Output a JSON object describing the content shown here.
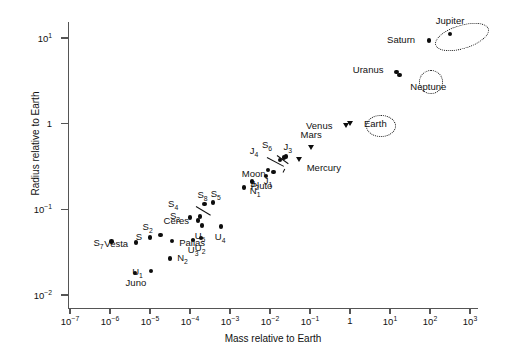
{
  "chart_data": {
    "type": "scatter",
    "title": "",
    "xlabel": "Mass relative to Earth",
    "ylabel": "Radius relative to Earth",
    "xscale": "log",
    "yscale": "log",
    "xlim": [
      1e-07,
      1000.0
    ],
    "ylim": [
      0.01,
      30
    ],
    "xticks": [
      "10-7",
      "10-6",
      "10-5",
      "10-4",
      "10-3",
      "10-2",
      "10-1",
      "1",
      "101",
      "102",
      "103"
    ],
    "yticks": [
      "101",
      "1",
      "10-1",
      "10-2"
    ],
    "grid": false,
    "legend": "none",
    "marker_types": {
      "planet": "down-triangle",
      "moon-or-asteroid": "filled-circle"
    },
    "points": [
      {
        "name": "Jupiter",
        "mass": 318,
        "radius": 11.2,
        "marker": "dot",
        "label_dx": 0,
        "label_dy": -13,
        "label_anchor": "center"
      },
      {
        "name": "Saturn",
        "mass": 95,
        "radius": 9.4,
        "marker": "dot",
        "label_dx": -14,
        "label_dy": 0,
        "label_anchor": "right"
      },
      {
        "name": "Uranus",
        "mass": 14.5,
        "radius": 4.0,
        "marker": "dot",
        "label_dx": -13,
        "label_dy": -2,
        "label_anchor": "right"
      },
      {
        "name": "Neptune",
        "mass": 17.1,
        "radius": 3.7,
        "marker": "dot",
        "label_dx": 11,
        "label_dy": 12,
        "label_anchor": "left"
      },
      {
        "name": "Venus",
        "mass": 0.815,
        "radius": 0.95,
        "marker": "tri",
        "label_dx": -14,
        "label_dy": 0,
        "label_anchor": "right"
      },
      {
        "name": "Earth",
        "mass": 1.0,
        "radius": 1.0,
        "marker": "tri",
        "label_dx": 14,
        "label_dy": 0,
        "label_anchor": "left"
      },
      {
        "name": "Mars",
        "mass": 0.107,
        "radius": 0.53,
        "marker": "tri",
        "label_dx": 0,
        "label_dy": -12,
        "label_anchor": "center"
      },
      {
        "name": "Pluto",
        "mass": 0.0022,
        "radius": 0.18,
        "marker": "dot",
        "label_dx": 7,
        "label_dy": -1,
        "label_anchor": "left"
      },
      {
        "name": "Mercury",
        "mass": 0.0553,
        "radius": 0.383,
        "marker": "tri",
        "label_dx": 7,
        "label_dy": 9,
        "label_anchor": "left"
      },
      {
        "name": "Moon",
        "mass": 0.0123,
        "radius": 0.273,
        "marker": "dot",
        "label_dx": -8,
        "label_dy": 2,
        "label_anchor": "right"
      },
      {
        "name": "J1",
        "mass": 0.0089,
        "radius": 0.286,
        "marker": "dot",
        "label_dx": 0,
        "label_dy": 11,
        "label_anchor": "center"
      },
      {
        "name": "J2",
        "mass": 0.008,
        "radius": 0.245,
        "marker": "dot",
        "label_dx": -7,
        "label_dy": 8,
        "label_anchor": "right"
      },
      {
        "name": "J3",
        "mass": 0.0248,
        "radius": 0.413,
        "marker": "dot",
        "label_dx": 2,
        "label_dy": -10,
        "label_anchor": "center"
      },
      {
        "name": "J4",
        "mass": 0.018,
        "radius": 0.378,
        "marker": "dot",
        "label_dx": -22,
        "label_dy": -9,
        "label_anchor": "right"
      },
      {
        "name": "N1",
        "mass": 0.00358,
        "radius": 0.212,
        "marker": "dot",
        "label_dx": 3,
        "label_dy": 10,
        "label_anchor": "center"
      },
      {
        "name": "S6",
        "mass": 0.0225,
        "radius": 0.404,
        "marker": "dot",
        "label_dx": -12,
        "label_dy": -12,
        "label_anchor": "right"
      },
      {
        "name": "S5",
        "mass": 0.00037,
        "radius": 0.12,
        "marker": "dot",
        "label_dx": 3,
        "label_dy": -9,
        "label_anchor": "center"
      },
      {
        "name": "S8",
        "mass": 0.00023,
        "radius": 0.115,
        "marker": "dot",
        "label_dx": -2,
        "label_dy": -9,
        "label_anchor": "center"
      },
      {
        "name": "S4",
        "mass": 0.00018,
        "radius": 0.0825,
        "marker": "dot",
        "label_dx": -22,
        "label_dy": -12,
        "label_anchor": "right"
      },
      {
        "name": "S3",
        "mass": 0.0001,
        "radius": 0.0805,
        "marker": "dot",
        "label_dx": -10,
        "label_dy": -1,
        "label_anchor": "right"
      },
      {
        "name": "U5",
        "mass": 0.0002,
        "radius": 0.0645,
        "marker": "dot",
        "label_dx": -2,
        "label_dy": 10,
        "label_anchor": "center"
      },
      {
        "name": "U4",
        "mass": 0.0006,
        "radius": 0.0628,
        "marker": "dot",
        "label_dx": -1,
        "label_dy": 10,
        "label_anchor": "center"
      },
      {
        "name": "U3",
        "mass": 0.00012,
        "radius": 0.0436,
        "marker": "dot",
        "label_dx": 0,
        "label_dy": 10,
        "label_anchor": "center"
      },
      {
        "name": "U2",
        "mass": 0.00019,
        "radius": 0.046,
        "marker": "dot",
        "label_dx": -1,
        "label_dy": 10,
        "label_anchor": "center"
      },
      {
        "name": "U1",
        "mass": 1.05e-05,
        "radius": 0.019,
        "marker": "dot",
        "label_dx": -8,
        "label_dy": 1,
        "label_anchor": "right"
      },
      {
        "name": "N2",
        "mass": 3.2e-05,
        "radius": 0.0266,
        "marker": "dot",
        "label_dx": 7,
        "label_dy": -1,
        "label_anchor": "left"
      },
      {
        "name": "S7",
        "mass": 1.1e-06,
        "radius": 0.042,
        "marker": "dot",
        "label_dx": -8,
        "label_dy": 1,
        "label_anchor": "right"
      },
      {
        "name": "S2",
        "mass": 1.85e-05,
        "radius": 0.05,
        "marker": "dot",
        "label_dx": -8,
        "label_dy": -8,
        "label_anchor": "right"
      },
      {
        "name": "S",
        "mass": 1e-05,
        "radius": 0.047,
        "marker": "dot",
        "label_dx": -8,
        "label_dy": 0,
        "label_anchor": "right"
      },
      {
        "name": "Vesta",
        "mass": 4.5e-06,
        "radius": 0.041,
        "marker": "dot",
        "label_dx": -8,
        "label_dy": 1,
        "label_anchor": "right"
      },
      {
        "name": "Ceres",
        "mass": 0.000158,
        "radius": 0.074,
        "marker": "dot",
        "label_dx": -9,
        "label_dy": 0,
        "label_anchor": "right"
      },
      {
        "name": "Pallas",
        "mass": 3.6e-05,
        "radius": 0.043,
        "marker": "dot",
        "label_dx": 7,
        "label_dy": 2,
        "label_anchor": "left"
      },
      {
        "name": "Juno",
        "mass": 4.2e-06,
        "radius": 0.018,
        "marker": "dot",
        "label_dx": 1,
        "label_dy": 10,
        "label_anchor": "center"
      }
    ],
    "annotations": [
      {
        "kind": "ellipse",
        "group": [
          "Saturn",
          "Jupiter"
        ],
        "cx": 461,
        "cy": 36,
        "rx": 27,
        "ry": 11,
        "rotate": -17
      },
      {
        "kind": "ellipse",
        "group": [
          "Uranus",
          "Neptune"
        ],
        "cx": 430,
        "cy": 81,
        "rx": 11,
        "ry": 11,
        "rotate": 0
      },
      {
        "kind": "ellipse",
        "group": [
          "Venus",
          "Earth"
        ],
        "cx": 380,
        "cy": 125,
        "rx": 14,
        "ry": 10,
        "rotate": 0
      }
    ],
    "leader_lines": [
      {
        "from": "J4-label",
        "x1": 267,
        "y1": 157,
        "x2": 284,
        "y2": 166
      },
      {
        "from": "S6-label",
        "x1": 277,
        "y1": 155,
        "x2": 288,
        "y2": 163
      },
      {
        "from": "S4-label",
        "x1": 196,
        "y1": 206,
        "x2": 211,
        "y2": 215
      },
      {
        "from": "Moon-label",
        "x1": 283,
        "y1": 172,
        "x2": 285,
        "y2": 168
      }
    ]
  },
  "axes": {
    "ylabel": "Radius relative to Earth",
    "xlabel": "Mass relative to Earth",
    "yticks": [
      {
        "mant": "10",
        "exp": "1"
      },
      {
        "mant": "1",
        "exp": ""
      },
      {
        "mant": "10",
        "exp": "−1"
      },
      {
        "mant": "10",
        "exp": "−2"
      }
    ],
    "xticks": [
      {
        "mant": "10",
        "exp": "−7"
      },
      {
        "mant": "10",
        "exp": "−6"
      },
      {
        "mant": "10",
        "exp": "−5"
      },
      {
        "mant": "10",
        "exp": "−4"
      },
      {
        "mant": "10",
        "exp": "−3"
      },
      {
        "mant": "10",
        "exp": "−2"
      },
      {
        "mant": "10",
        "exp": "−1"
      },
      {
        "mant": "1",
        "exp": ""
      },
      {
        "mant": "10",
        "exp": "1"
      },
      {
        "mant": "10",
        "exp": "2"
      },
      {
        "mant": "10",
        "exp": "3"
      }
    ]
  }
}
